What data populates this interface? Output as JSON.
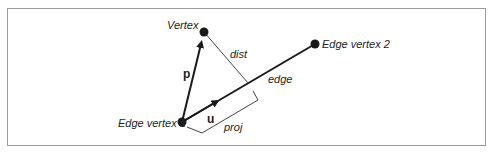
{
  "diagram": {
    "labels": {
      "vertex": "Vertex",
      "edge_vertex_1": "Edge vertex 1",
      "edge_vertex_2": "Edge vertex 2",
      "vector_p": "p",
      "vector_u": "u",
      "dist": "dist",
      "edge": "edge",
      "proj": "proj"
    },
    "points": {
      "vertex": [
        204,
        32
      ],
      "edge_vertex_1": [
        182,
        122
      ],
      "edge_vertex_2": [
        315,
        44
      ],
      "foot": [
        248,
        83
      ]
    },
    "colors": {
      "stroke": "#1a1a1a",
      "thin": "#444444",
      "frame": "#9a9a9a"
    }
  }
}
